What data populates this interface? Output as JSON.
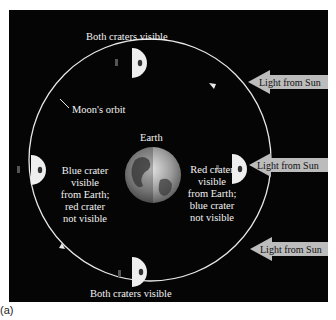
{
  "figure": {
    "caption": "(a)",
    "header_fragment": "the Moon's ..."
  },
  "labels": {
    "top_moon": "Both craters visible",
    "bottom_moon": "Both craters visible",
    "orbit": "Moon's orbit",
    "earth": "Earth",
    "left_moon": [
      "Blue crater",
      "visible",
      "from Earth;",
      "red crater",
      "not visible"
    ],
    "right_moon": [
      "Red crater",
      "visible",
      "from Earth;",
      "blue crater",
      "not visible"
    ]
  },
  "sun_arrows": [
    {
      "label": "Light from Sun",
      "y": 82
    },
    {
      "label": "Light from Sun",
      "y": 165
    },
    {
      "label": "Light from Sun",
      "y": 249
    }
  ],
  "colors": {
    "background": "#050505",
    "orbit": "#e8e8e8",
    "moon_lit": "#eeeeee",
    "arrow_fill": "#bcbcbc",
    "text": "#f2f2f2"
  }
}
